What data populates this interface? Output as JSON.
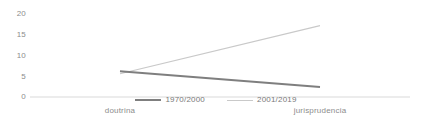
{
  "chart_data": {
    "type": "line",
    "title": "",
    "xlabel": "",
    "ylabel": "",
    "categories": [
      "doutrina",
      "jurisprudencia"
    ],
    "series": [
      {
        "name": "1970/2000",
        "values": [
          6.2,
          2.4
        ],
        "color": "#7f7f7f"
      },
      {
        "name": "2001/2019",
        "values": [
          5.6,
          17.2
        ],
        "color": "#c9c9c9"
      }
    ],
    "yticks": [
      0,
      5,
      10,
      15,
      20
    ],
    "ytick_labels": [
      "0",
      "5",
      "10",
      "15",
      "20"
    ],
    "ylim": [
      0,
      20
    ],
    "grid": false,
    "legend_position": "bottom",
    "baseline_color": "#d9d9d9"
  },
  "axis": {
    "tick_0": "0",
    "tick_1": "5",
    "tick_2": "10",
    "tick_3": "15",
    "tick_4": "20"
  },
  "categories": {
    "left": "doutrina",
    "right": "jurisprudencia"
  },
  "legend": {
    "item_0": "1970/2000",
    "item_1": "2001/2019"
  }
}
